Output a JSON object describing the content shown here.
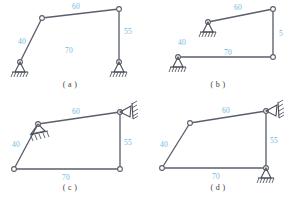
{
  "figure": {
    "type": "structural-frame-diagram-set",
    "colors": {
      "member": "#5a5f6b",
      "dimension_text": "#6fb7e0",
      "support": "#4a4f5a",
      "background": "#ffffff",
      "caption": "#3d3d3d"
    },
    "panels": [
      {
        "id": "a",
        "caption": "( a )",
        "dimensions": [
          {
            "label": "40",
            "member": "left-inclined-column"
          },
          {
            "label": "60",
            "member": "top-beam"
          },
          {
            "label": "55",
            "member": "right-column"
          },
          {
            "label": "70",
            "member": "base-span"
          }
        ],
        "supports": [
          {
            "kind": "pin-hatched",
            "location": "bottom-left"
          },
          {
            "kind": "pin-hatched",
            "location": "bottom-right"
          }
        ],
        "joints": 4
      },
      {
        "id": "b",
        "caption": "( b )",
        "dimensions": [
          {
            "label": "40",
            "member": "left-vertical-gap"
          },
          {
            "label": "60",
            "member": "top-beam"
          },
          {
            "label": "5",
            "member": "right-column"
          },
          {
            "label": "70",
            "member": "base-span"
          }
        ],
        "supports": [
          {
            "kind": "pin-hatched",
            "location": "upper-left"
          },
          {
            "kind": "pin-hatched",
            "location": "lower-left"
          }
        ],
        "joints": 3
      },
      {
        "id": "c",
        "caption": "( c )",
        "dimensions": [
          {
            "label": "40",
            "member": "left-inclined-column"
          },
          {
            "label": "60",
            "member": "top-beam"
          },
          {
            "label": "55",
            "member": "right-column"
          },
          {
            "label": "70",
            "member": "base-span"
          }
        ],
        "supports": [
          {
            "kind": "pin-inclined-hatched",
            "location": "upper-left-joint"
          },
          {
            "kind": "pin-inclined-hatched",
            "location": "upper-right-joint"
          }
        ],
        "joints": 4
      },
      {
        "id": "d",
        "caption": "( d )",
        "dimensions": [
          {
            "label": "40",
            "member": "left-inclined-column"
          },
          {
            "label": "60",
            "member": "top-beam"
          },
          {
            "label": "55",
            "member": "right-column"
          },
          {
            "label": "70",
            "member": "base-span"
          }
        ],
        "supports": [
          {
            "kind": "pin-inclined-hatched",
            "location": "upper-right-joint"
          },
          {
            "kind": "pin-hatched",
            "location": "bottom-right"
          }
        ],
        "joints": 4
      }
    ]
  }
}
